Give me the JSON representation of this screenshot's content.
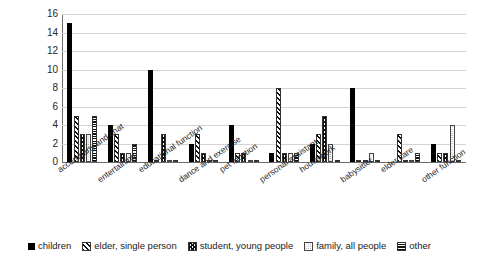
{
  "chart_data": {
    "type": "bar",
    "title": "",
    "xlabel": "",
    "ylabel": "",
    "ylim": [
      0,
      16
    ],
    "ytick_step": 2,
    "yticks": [
      16,
      14,
      12,
      10,
      8,
      6,
      4,
      2,
      0
    ],
    "grid": true,
    "legend_position": "bottom",
    "categories": [
      "accompany and chat",
      "entertaining",
      "educational function",
      "dance and exercise",
      "pet function",
      "personal assistant",
      "housework",
      "babysitter",
      "elder care",
      "other function"
    ],
    "series": [
      {
        "name": "children",
        "pattern": "solid-black",
        "values": [
          15,
          4,
          10,
          2,
          4,
          1,
          2,
          8,
          0,
          2
        ]
      },
      {
        "name": "elder, single person",
        "pattern": "diagonal-hatch",
        "values": [
          5,
          3,
          0,
          3,
          1,
          8,
          3,
          0,
          3,
          1
        ]
      },
      {
        "name": "student, young people",
        "pattern": "cross-hatch",
        "values": [
          3,
          1,
          3,
          1,
          1,
          1,
          5,
          0,
          0,
          1
        ]
      },
      {
        "name": "family, all people",
        "pattern": "dotted",
        "values": [
          3,
          1,
          0,
          0,
          0,
          1,
          2,
          1,
          0,
          4
        ]
      },
      {
        "name": "other",
        "pattern": "horizontal-stripe",
        "values": [
          5,
          2,
          0,
          0,
          0,
          1,
          0,
          0,
          1,
          0
        ]
      }
    ],
    "legend_entries": [
      "children",
      "elder, single person",
      "student, young people",
      "family, all people",
      "other"
    ],
    "colors": {
      "bar_outline": "#111111",
      "gridline": "#d4d4d4",
      "axis": "#6b6b6b",
      "text": "#1a1a1a",
      "background": "#ffffff"
    }
  }
}
